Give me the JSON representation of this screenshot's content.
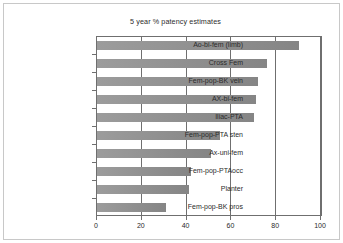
{
  "chart_data": {
    "type": "bar",
    "orientation": "horizontal",
    "title": "5 year % patency estimates",
    "xlabel": "",
    "ylabel": "",
    "xlim": [
      0,
      100
    ],
    "xticks": [
      0,
      20,
      40,
      60,
      80,
      100
    ],
    "grid": true,
    "legend": false,
    "bar_color": "#8f8f8f",
    "axis_color": "#6f6f6f",
    "frame_color": "#c8c8c8",
    "categories": [
      "Ao-bi-fem (limb)",
      "Cross Fem",
      "Fem-pop-BK vein",
      "AX-bi-fem",
      "Iliac-PTA",
      "Fem-pop-PTA sten",
      "Ax-uni-fem",
      "Fem-pop-PTAocc",
      "Planter",
      "Fem-pop-BK pros"
    ],
    "values": [
      90,
      76,
      72,
      71,
      70,
      55,
      51,
      42,
      41,
      31
    ]
  }
}
